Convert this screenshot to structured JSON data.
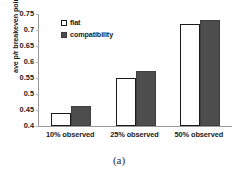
{
  "caption": "(a)",
  "chart_data": {
    "type": "bar",
    "title": "",
    "xlabel": "",
    "ylabel": "ave p/r breakeven point",
    "categories": [
      "10% observed",
      "25% observed",
      "50% observed"
    ],
    "series": [
      {
        "name": "flat",
        "values": [
          0.442,
          0.55,
          0.718
        ],
        "color": "#ffffff"
      },
      {
        "name": "compatibility",
        "values": [
          0.464,
          0.572,
          0.73
        ],
        "color": "#4d4d4d"
      }
    ],
    "ylim": [
      0.4,
      0.75
    ],
    "ytick_values": [
      0.4,
      0.45,
      0.5,
      0.55,
      0.6,
      0.65,
      0.7,
      0.75
    ],
    "ytick_labels": [
      "0.4",
      "0.45",
      "0.5",
      "0.55",
      "0.6",
      "0.65",
      "0.7",
      "0.75"
    ],
    "grid": false,
    "legend_position": "top-left",
    "axis_color": "#9a9a9a",
    "text_color": "#1a1a1a"
  }
}
